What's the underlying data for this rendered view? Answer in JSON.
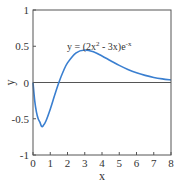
{
  "chart_data": {
    "type": "line",
    "title": "",
    "xlabel": "x",
    "ylabel": "y",
    "xlim": [
      0,
      8
    ],
    "ylim": [
      -1,
      1
    ],
    "xticks": [
      0,
      1,
      2,
      3,
      4,
      5,
      6,
      7,
      8
    ],
    "xtick_labels": [
      "0",
      "1",
      "2",
      "3",
      "4",
      "5",
      "6",
      "7",
      "8"
    ],
    "yticks": [
      1,
      0.5,
      0,
      -0.5,
      -1
    ],
    "ytick_labels": [
      "1",
      "0.5",
      "0",
      "-0.5",
      "-1"
    ],
    "grid": false,
    "zero_line": true,
    "annotation": "y = (2x² - 3x)e⁻ˣ",
    "annotation_parts": {
      "pre": "y = (2x",
      "sup1": "2",
      "mid": " - 3x)e",
      "sup2": "-x"
    },
    "series": [
      {
        "name": "y = (2x^2 - 3x)e^-x",
        "color": "#3a7fd0",
        "x": [
          0,
          0.1,
          0.2,
          0.3,
          0.4,
          0.5,
          0.6,
          0.75,
          1.0,
          1.25,
          1.5,
          1.75,
          2.0,
          2.5,
          3.0,
          3.5,
          4.0,
          4.5,
          5.0,
          5.5,
          6.0,
          6.5,
          7.0,
          7.5,
          8.0
        ],
        "values": [
          0,
          -0.253,
          -0.409,
          -0.5,
          -0.547,
          -0.607,
          -0.593,
          -0.531,
          -0.368,
          -0.179,
          0,
          0.152,
          0.271,
          0.41,
          0.448,
          0.423,
          0.366,
          0.3,
          0.236,
          0.18,
          0.134,
          0.098,
          0.07,
          0.05,
          0.035
        ]
      }
    ]
  },
  "colors": {
    "axes": "#555555",
    "curve": "#3a7fd0",
    "zero_line": "#555555",
    "text": "#333333"
  }
}
